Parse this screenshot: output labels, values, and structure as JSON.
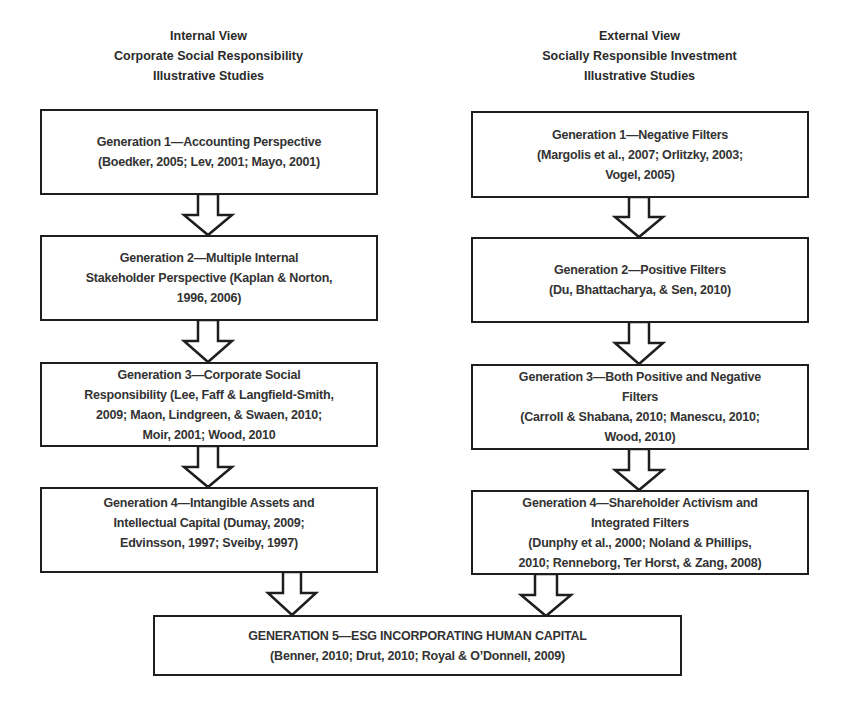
{
  "columns": {
    "internal": {
      "header": [
        "Internal View",
        "Corporate Social Responsibility",
        "Illustrative Studies"
      ],
      "boxes": [
        {
          "lines": [
            "Generation 1—Accounting Perspective",
            "(Boedker, 2005; Lev, 2001; Mayo, 2001)"
          ]
        },
        {
          "lines": [
            "Generation 2—Multiple Internal",
            "Stakeholder Perspective (Kaplan & Norton,",
            "1996, 2006)"
          ]
        },
        {
          "lines": [
            "Generation 3—Corporate Social",
            "Responsibility (Lee, Faff & Langfield-Smith,",
            "2009; Maon, Lindgreen, & Swaen, 2010;",
            "Moir, 2001; Wood, 2010"
          ]
        },
        {
          "lines": [
            "Generation 4—Intangible Assets and",
            "Intellectual Capital (Dumay, 2009;",
            "Edvinsson, 1997; Sveiby, 1997)"
          ]
        }
      ]
    },
    "external": {
      "header": [
        "External View",
        "Socially Responsible Investment",
        "Illustrative Studies"
      ],
      "boxes": [
        {
          "lines": [
            "Generation 1—Negative Filters",
            "(Margolis et al., 2007; Orlitzky, 2003;",
            "Vogel, 2005)"
          ]
        },
        {
          "lines": [
            "Generation 2—Positive Filters",
            "(Du, Bhattacharya, & Sen, 2010)"
          ]
        },
        {
          "lines": [
            "Generation 3—Both Positive and Negative",
            "Filters",
            "(Carroll & Shabana, 2010; Manescu, 2010;",
            "Wood, 2010)"
          ]
        },
        {
          "lines": [
            "Generation 4—Shareholder Activism and",
            "Integrated Filters",
            "(Dunphy et al., 2000; Noland & Phillips,",
            "2010; Renneborg, Ter Horst, & Zang, 2008)"
          ]
        }
      ]
    }
  },
  "final_box": {
    "lines": [
      "GENERATION 5—ESG INCORPORATING HUMAN CAPITAL",
      "(Benner, 2010; Drut, 2010; Royal & O’Donnell, 2009)"
    ]
  },
  "arrows": [
    {
      "from": "internal.gen1",
      "to": "internal.gen2"
    },
    {
      "from": "internal.gen2",
      "to": "internal.gen3"
    },
    {
      "from": "internal.gen3",
      "to": "internal.gen4"
    },
    {
      "from": "external.gen1",
      "to": "external.gen2"
    },
    {
      "from": "external.gen2",
      "to": "external.gen3"
    },
    {
      "from": "external.gen3",
      "to": "external.gen4"
    },
    {
      "from": "internal.gen4",
      "to": "generation5"
    },
    {
      "from": "external.gen4",
      "to": "generation5"
    }
  ]
}
